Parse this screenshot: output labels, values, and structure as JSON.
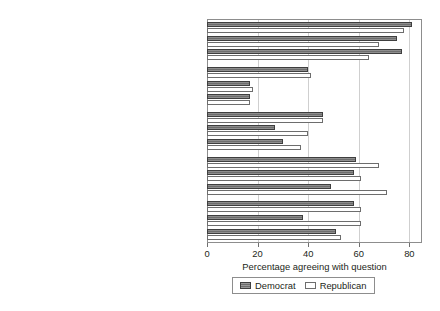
{
  "chart_data": {
    "type": "bar",
    "orientation": "horizontal",
    "title": "",
    "xlabel": "Percentage agreeing with question",
    "ylabel": "",
    "xlim": [
      0,
      85
    ],
    "xticks": [
      0,
      20,
      40,
      60,
      80
    ],
    "xtick_labels": [
      "0",
      "20",
      "40",
      "60",
      "80"
    ],
    "grid": "vertical",
    "legend": {
      "position": "bottom",
      "entries": [
        {
          "name": "Democrat",
          "color": "#6e6e6e",
          "style": "dark-hatched"
        },
        {
          "name": "Republican",
          "color": "#ffffff",
          "style": "white-outlined"
        }
      ]
    },
    "subcategories": [
      "Urban",
      "Suburban",
      "Rural"
    ],
    "series": [
      {
        "name": "Democrat",
        "key": "dem"
      },
      {
        "name": "Republican",
        "key": "rep"
      }
    ],
    "groups": [
      {
        "question": "More important to compromise",
        "rows": [
          {
            "subcategory": "Urban",
            "dem": 81,
            "rep": 78
          },
          {
            "subcategory": "Suburban",
            "dem": 75,
            "rep": 68
          },
          {
            "subcategory": "Rural",
            "dem": 77,
            "rep": 64
          }
        ]
      },
      {
        "question": "OK to hurl insults",
        "rows": [
          {
            "subcategory": "Urban",
            "dem": 40,
            "rep": 41
          },
          {
            "subcategory": "Suburban",
            "dem": 17,
            "rep": 18
          },
          {
            "subcategory": "Rural",
            "dem": 17,
            "rep": 17
          }
        ]
      },
      {
        "question": "Stick to tradition",
        "rows": [
          {
            "subcategory": "Urban",
            "dem": 46,
            "rep": 46
          },
          {
            "subcategory": "Suburban",
            "dem": 27,
            "rep": 40
          },
          {
            "subcategory": "Rural",
            "dem": 30,
            "rep": 37
          }
        ]
      },
      {
        "question": "Need tough leader",
        "rows": [
          {
            "subcategory": "Urban",
            "dem": 59,
            "rep": 68
          },
          {
            "subcategory": "Suburban",
            "dem": 58,
            "rep": 61
          },
          {
            "subcategory": "Rural",
            "dem": 49,
            "rep": 71
          }
        ]
      },
      {
        "question": "OK to ignore pol. correctness",
        "rows": [
          {
            "subcategory": "Urban",
            "dem": 58,
            "rep": 61
          },
          {
            "subcategory": "Suburban",
            "dem": 38,
            "rep": 61
          },
          {
            "subcategory": "Rural",
            "dem": 51,
            "rep": 53
          }
        ]
      }
    ]
  }
}
